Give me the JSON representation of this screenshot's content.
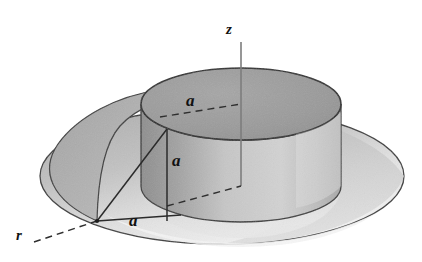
{
  "figure": {
    "kind": "3d-geometry-diagram",
    "background_color": "#ffffff",
    "outline_color": "#2b2b2b",
    "labels": {
      "z_axis": "z",
      "r_axis": "r",
      "top_radius": "a",
      "cylinder_height": "a",
      "base_radius": "a"
    },
    "colors": {
      "top_face": "#9a9a9a",
      "cylinder_wall_left": "#9c9c9c",
      "cylinder_wall_right": "#c9c9c9",
      "brim_left": "#b2b2b2",
      "brim_right": "#c4c4c4",
      "brim_front": "#ececec",
      "inner_trough": "#d6d6d6",
      "axis_line": "#7a7a7a",
      "dash_line": "#3a3a3a"
    },
    "geometry": {
      "z_axis_x": 241,
      "z_axis_top_y": 42,
      "z_axis_bottom_y": 186,
      "cylinder_center_top": [
        241,
        104
      ],
      "cylinder_top_rx": 100,
      "cylinder_top_ry": 36,
      "cylinder_height_px": 82,
      "vertex_point": [
        97,
        221
      ],
      "triangle_corner": [
        167,
        130
      ],
      "triangle_foot": [
        167,
        221
      ]
    }
  }
}
